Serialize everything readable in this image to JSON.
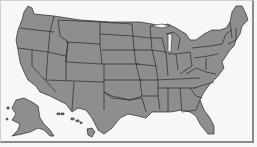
{
  "map": {
    "subject": "United States state boundaries",
    "colors": {
      "state_fill": "#8e8e8e",
      "state_border": "#2a2a2a",
      "background": "#f7f7f7",
      "frame": "#8a8a8a"
    },
    "regions": [
      "contiguous-us",
      "alaska",
      "hawaii"
    ]
  }
}
